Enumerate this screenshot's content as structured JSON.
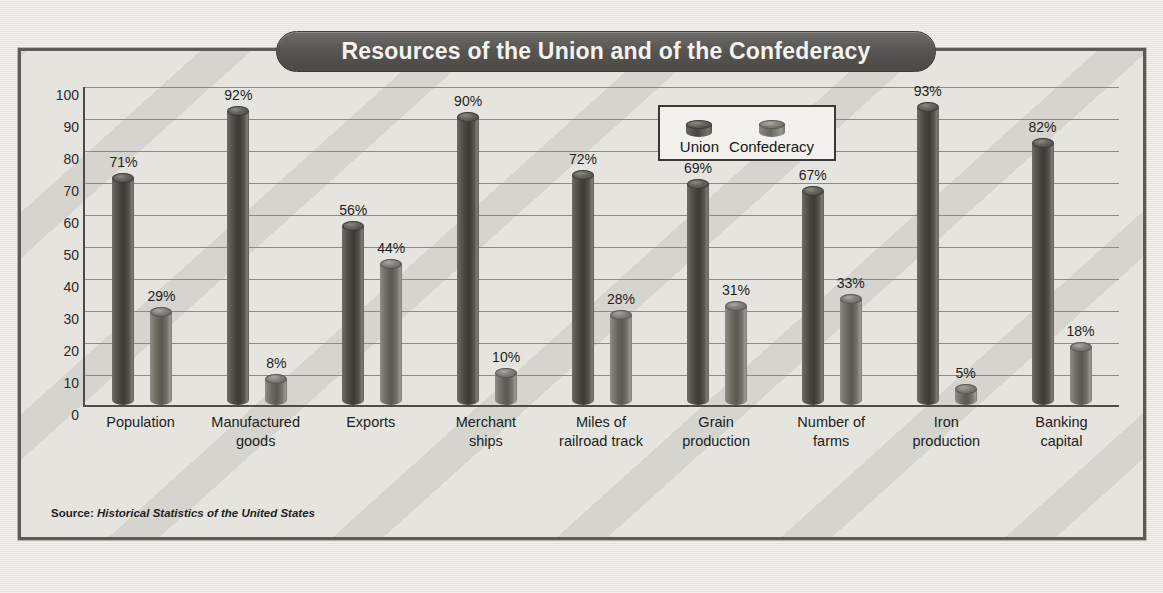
{
  "chart": {
    "title": "Resources of the Union and of the Confederacy",
    "source_label": "Source:",
    "source_text": "Historical Statistics of the United States"
  },
  "legend": {
    "items": [
      {
        "label": "Union",
        "icon": "cylinder-swatch-icon",
        "color": "#46453f"
      },
      {
        "label": "Confederacy",
        "icon": "cylinder-swatch-icon",
        "color": "#76756d"
      }
    ]
  },
  "chart_data": {
    "type": "bar",
    "title": "Resources of the Union and of the Confederacy",
    "xlabel": "",
    "ylabel": "",
    "ylim": [
      0,
      100
    ],
    "yticks": [
      0,
      10,
      20,
      30,
      40,
      50,
      60,
      70,
      80,
      90,
      100
    ],
    "ytick_labels": [
      "0",
      "10",
      "20",
      "30",
      "40",
      "50",
      "60",
      "70",
      "80",
      "90",
      "100"
    ],
    "grid": true,
    "legend_position": "top-right-inside",
    "value_format": "percent",
    "categories": [
      "Population",
      "Manufactured goods",
      "Exports",
      "Merchant ships",
      "Miles of railroad track",
      "Grain production",
      "Number of farms",
      "Iron production",
      "Banking capital"
    ],
    "category_lines": [
      [
        "Population"
      ],
      [
        "Manufactured",
        "goods"
      ],
      [
        "Exports"
      ],
      [
        "Merchant",
        "ships"
      ],
      [
        "Miles of",
        "railroad track"
      ],
      [
        "Grain",
        "production"
      ],
      [
        "Number of",
        "farms"
      ],
      [
        "Iron",
        "production"
      ],
      [
        "Banking",
        "capital"
      ]
    ],
    "series": [
      {
        "name": "Union",
        "values": [
          71,
          92,
          56,
          90,
          72,
          69,
          67,
          93,
          82
        ],
        "labels": [
          "71%",
          "92%",
          "56%",
          "90%",
          "72%",
          "69%",
          "67%",
          "93%",
          "82%"
        ]
      },
      {
        "name": "Confederacy",
        "values": [
          29,
          8,
          44,
          10,
          28,
          31,
          33,
          5,
          18
        ],
        "labels": [
          "29%",
          "8%",
          "44%",
          "10%",
          "28%",
          "31%",
          "33%",
          "5%",
          "18%"
        ]
      }
    ]
  }
}
